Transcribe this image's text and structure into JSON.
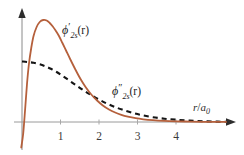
{
  "chart_data": {
    "type": "line",
    "title": "",
    "subtitle": "",
    "xlabel": "r/a_0",
    "ylabel": "",
    "xlim": [
      -0.18,
      5.35
    ],
    "ylim": [
      -0.26,
      1.12
    ],
    "grid": false,
    "legend_position": "inline-annotations",
    "xticks": [
      1,
      2,
      3,
      4
    ],
    "xtick_labels": [
      "1",
      "2",
      "3",
      "4"
    ],
    "yticks": [],
    "ytick_labels": [],
    "background_color": "#ffffff",
    "axis_color": "#5a5a5a",
    "series": [
      {
        "name": "phi'_2s(r)",
        "label_text": "ϕ",
        "label_sub": "2s",
        "label_prime": "′",
        "label_arg": "(r)",
        "style": "solid",
        "color": "#b5603c",
        "line_width": 1.8,
        "x": [
          -0.02,
          0.03,
          0.08,
          0.13,
          0.18,
          0.24,
          0.3,
          0.38,
          0.46,
          0.55,
          0.64,
          0.72,
          0.8,
          0.88,
          0.96,
          1.05,
          1.15,
          1.25,
          1.38,
          1.52,
          1.66,
          1.8,
          1.95,
          2.1,
          2.26,
          2.42,
          2.58,
          2.75,
          2.95,
          3.15,
          3.4,
          3.7,
          4.0,
          4.35,
          4.7,
          5.05,
          5.3
        ],
        "y": [
          -0.255,
          -0.12,
          0.12,
          0.38,
          0.58,
          0.74,
          0.86,
          0.95,
          1.0,
          1.02,
          1.015,
          0.99,
          0.955,
          0.91,
          0.86,
          0.79,
          0.71,
          0.63,
          0.53,
          0.43,
          0.345,
          0.275,
          0.215,
          0.165,
          0.125,
          0.095,
          0.072,
          0.054,
          0.038,
          0.027,
          0.018,
          0.011,
          0.007,
          0.004,
          0.002,
          0.001,
          0.0005
        ]
      },
      {
        "name": "phi''_2s(r)",
        "label_text": "ϕ",
        "label_sub": "2s",
        "label_prime": "″",
        "label_arg": "(r)",
        "style": "dashed",
        "color": "#151515",
        "line_width": 2.1,
        "dash_pattern": [
          5,
          4
        ],
        "x": [
          0.0,
          0.15,
          0.3,
          0.45,
          0.6,
          0.75,
          0.9,
          1.05,
          1.2,
          1.35,
          1.5,
          1.65,
          1.8,
          2.0,
          2.2,
          2.4,
          2.6,
          2.85,
          3.1,
          3.4,
          3.7,
          4.0,
          4.35,
          4.7,
          5.05,
          5.3
        ],
        "y": [
          0.605,
          0.6,
          0.592,
          0.578,
          0.558,
          0.532,
          0.5,
          0.462,
          0.422,
          0.382,
          0.342,
          0.303,
          0.268,
          0.224,
          0.185,
          0.152,
          0.124,
          0.094,
          0.07,
          0.048,
          0.033,
          0.023,
          0.014,
          0.008,
          0.004,
          0.002
        ]
      }
    ],
    "annotations": [
      {
        "name": "phi-prime-2s-label",
        "text": "ϕ′_2s(r)",
        "x_px": 62,
        "y_px": 32
      },
      {
        "name": "phi-double-prime-2s-label",
        "text": "ϕ″_2s(r)",
        "x_px": 112,
        "y_px": 93
      },
      {
        "name": "x-axis-label",
        "text": "r/a_0",
        "x_px": 196,
        "y_px": 108
      }
    ]
  },
  "axis": {
    "x_label_r": "r",
    "x_label_slash": "/",
    "x_label_a": "a",
    "x_label_zero": "0"
  },
  "labels": {
    "phi_glyph": "ϕ",
    "subscript_2s": "2s",
    "single_prime": "′",
    "double_prime": "″",
    "argument": "(r)"
  },
  "ticks": {
    "t1": "1",
    "t2": "2",
    "t3": "3",
    "t4": "4"
  },
  "colors": {
    "solid_curve": "#b5603c",
    "dashed_curve": "#151515",
    "axis": "#5a5a5a",
    "tick_text": "#3a3a3a",
    "background": "#ffffff"
  }
}
